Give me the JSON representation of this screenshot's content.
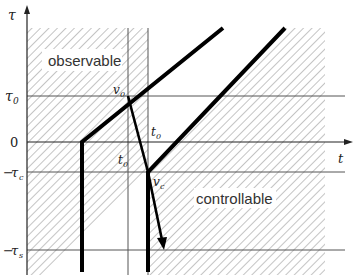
{
  "diagram": {
    "axes": {
      "x_label": "t",
      "y_label": "τ"
    },
    "y_ticks": [
      {
        "label": "τ",
        "sub": "0",
        "prefix": ""
      },
      {
        "label": "0",
        "sub": "",
        "prefix": ""
      },
      {
        "label": "τ",
        "sub": "c",
        "prefix": "−"
      },
      {
        "label": "τ",
        "sub": "s",
        "prefix": "−"
      }
    ],
    "regions": {
      "observable": "observable",
      "controllable": "controllable"
    },
    "points": {
      "v0": {
        "label": "v",
        "sub": "0"
      },
      "vc": {
        "label": "v",
        "sub": "c"
      },
      "t0_upper": {
        "label": "t",
        "sub": "0"
      },
      "t0_lower": {
        "label": "t",
        "sub": "0"
      }
    },
    "colors": {
      "line": "#000000",
      "grid": "#555555",
      "hatch": "#8a8a8a",
      "background": "#ffffff"
    }
  }
}
